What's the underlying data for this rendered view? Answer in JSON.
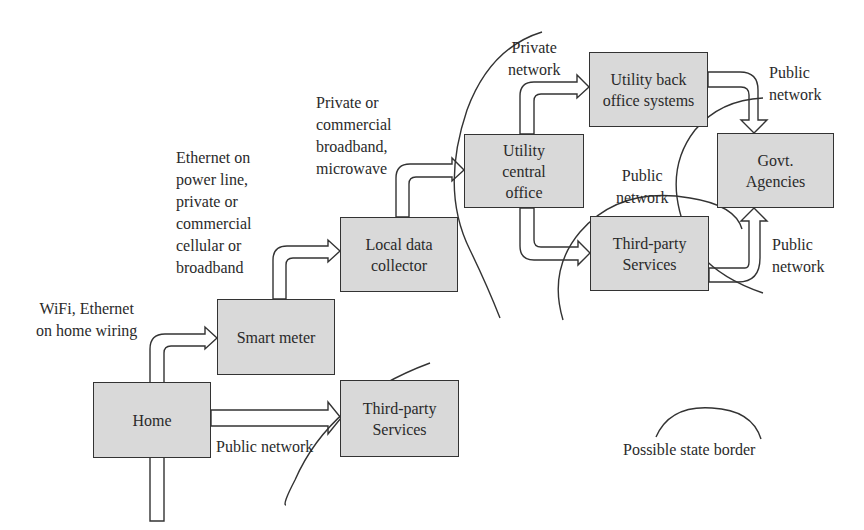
{
  "diagram": {
    "boxes": {
      "home": "Home",
      "smart_meter": "Smart meter",
      "local_data_collector": "Local data\ncollector",
      "third_party_home": "Third-party\nServices",
      "utility_central_office": "Utility\ncentral\noffice",
      "utility_back_office": "Utility back\noffice systems",
      "third_party_utility": "Third-party\nServices",
      "govt_agencies": "Govt.\nAgencies"
    },
    "links": {
      "home_to_meter": "WiFi, Ethernet\non home wiring",
      "meter_to_collector": "Ethernet on\npower line,\nprivate or\ncommercial\ncellular or\nbroadband",
      "collector_to_central": "Private or\ncommercial\nbroadband,\nmicrowave",
      "central_to_backoffice": "Private\nnetwork",
      "central_to_thirdparty": "Public\nnetwork",
      "backoffice_to_govt": "Public\nnetwork",
      "thirdparty_to_govt": "Public\nnetwork",
      "home_to_thirdparty": "Public network"
    },
    "legend": {
      "state_border": "Possible state border"
    }
  }
}
